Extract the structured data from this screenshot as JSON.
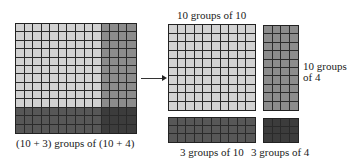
{
  "colors": {
    "light": "#d2d2d2",
    "medium": "#8c8c8c",
    "dark": "#575757",
    "darkest": "#3c3c3c",
    "line": "#222222"
  },
  "left_figure": {
    "rows": 13,
    "cols": 14,
    "split_row": 10,
    "split_col": 10,
    "caption": "(10 + 3) groups of (10 + 4)"
  },
  "right_figure": {
    "blocks": [
      {
        "id": "10x10",
        "rows": 10,
        "cols": 10,
        "shade": "light",
        "label": "10 groups of 10"
      },
      {
        "id": "10x4",
        "rows": 10,
        "cols": 4,
        "shade": "medium",
        "label_line1": "10 groups",
        "label_line2": "of 4"
      },
      {
        "id": "3x10",
        "rows": 3,
        "cols": 10,
        "shade": "dark",
        "label": "3 groups of 10"
      },
      {
        "id": "3x4",
        "rows": 3,
        "cols": 4,
        "shade": "darkest",
        "label": "3 groups of 4"
      }
    ]
  },
  "arrow": {
    "direction": "right",
    "icon": "arrow-right-icon"
  }
}
